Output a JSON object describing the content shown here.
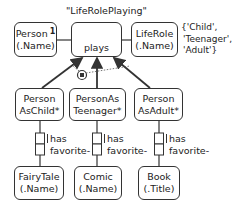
{
  "diagram": {
    "title": "\"LifeRolePlaying\"",
    "top_row": {
      "person": {
        "line1": "Person",
        "superscript": "1",
        "line2": "(.Name)"
      },
      "plays": {
        "label": "plays"
      },
      "liferole": {
        "line1": "LifeRole",
        "line2": "(.Name)"
      },
      "value_constraint": {
        "line1": "{'Child',",
        "line2": "'Teenager',",
        "line3": "'Adult'}"
      }
    },
    "subtypes": [
      {
        "line1": "Person",
        "line2": "AsChild*"
      },
      {
        "line1": "PersonAs",
        "line2": "Teenager*"
      },
      {
        "line1": "Person",
        "line2": "AsAdult*"
      }
    ],
    "fact_types": [
      {
        "line1": "has",
        "line2": "favorite-"
      },
      {
        "line1": "has",
        "line2": "favorite-"
      },
      {
        "line1": "has",
        "line2": "favorite-"
      }
    ],
    "bottom_row": [
      {
        "line1": "FairyTale",
        "line2": "(.Name)"
      },
      {
        "line1": "Comic",
        "line2": "(.Name)"
      },
      {
        "line1": "Book",
        "line2": "(.Title)"
      }
    ],
    "constraint": "exclusion-constraint"
  }
}
